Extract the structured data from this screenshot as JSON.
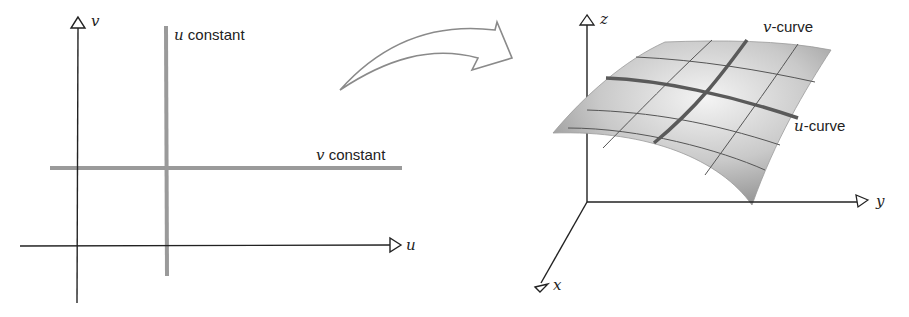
{
  "diagram": {
    "left_panel": {
      "axis_u_label": "u",
      "axis_v_label": "v",
      "u_constant_var": "u",
      "u_constant_text": " constant",
      "v_constant_var": "v",
      "v_constant_text": " constant"
    },
    "arrow": {
      "description": "curved hollow arrow mapping parameter plane to surface"
    },
    "right_panel": {
      "axis_x_label": "x",
      "axis_y_label": "y",
      "axis_z_label": "z",
      "v_curve_var": "v",
      "v_curve_text": "-curve",
      "u_curve_var": "u",
      "u_curve_text": "-curve"
    },
    "colors": {
      "axis": "#222222",
      "param_line": "#9a9a9a",
      "surface_light": "#f2f2f2",
      "surface_dark": "#8c8c8c",
      "grid_line": "#555555",
      "highlight_curve": "#5a5a5a"
    }
  }
}
